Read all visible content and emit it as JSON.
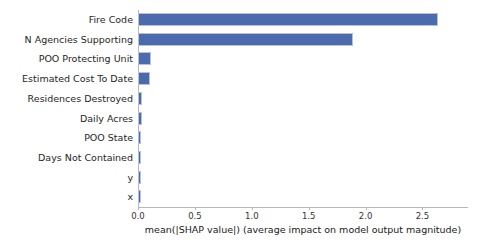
{
  "chart_data": {
    "type": "bar",
    "orientation": "horizontal",
    "title": "",
    "xlabel": "mean(|SHAP value|) (average impact on model output magnitude)",
    "ylabel": "",
    "categories": [
      "Fire Code",
      "N Agencies Supporting",
      "POO Protecting Unit",
      "Estimated Cost To Date",
      "Residences Destroyed",
      "Daily Acres",
      "POO State",
      "Days Not Contained",
      "y",
      "x"
    ],
    "values": [
      2.64,
      1.89,
      0.11,
      0.105,
      0.035,
      0.032,
      0.03,
      0.028,
      0.025,
      0.022
    ],
    "xlim": [
      0.0,
      2.9
    ],
    "xticks": [
      0.0,
      0.5,
      1.0,
      1.5,
      2.0,
      2.5
    ],
    "xticklabels": [
      "0.0",
      "0.5",
      "1.0",
      "1.5",
      "2.0",
      "2.5"
    ],
    "grid": false,
    "legend": null,
    "bar_color": "#4c6baf",
    "axis_color": "#b7b7bd",
    "background": "#ffffff"
  }
}
